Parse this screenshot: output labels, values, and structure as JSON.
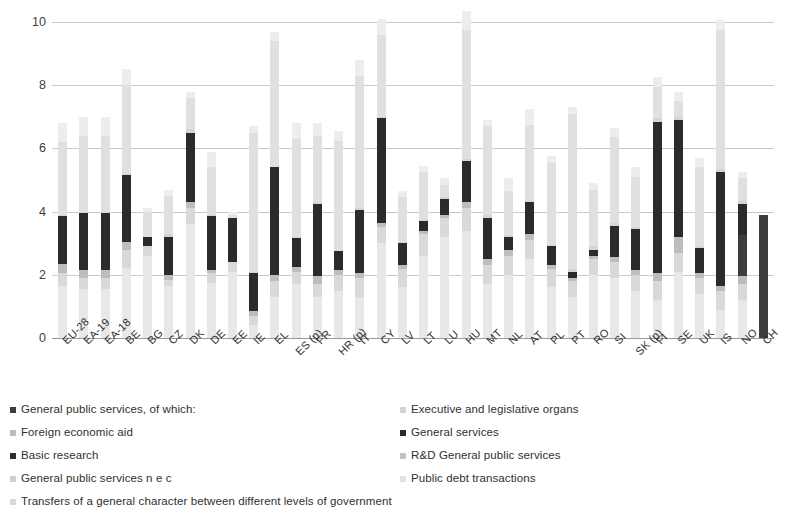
{
  "chart_data": {
    "type": "bar",
    "stacked": true,
    "title": "",
    "subtitle": "",
    "xlabel": "",
    "ylabel": "",
    "ylim": [
      0,
      10
    ],
    "yticks": [
      0,
      2,
      4,
      6,
      8,
      10
    ],
    "ytick_labels": [
      "0",
      "2",
      "4",
      "6",
      "8",
      "10"
    ],
    "grid": true,
    "legend_position": "bottom",
    "categories": [
      "EU-28",
      "EA-19",
      "EA-18",
      "BE",
      "BG",
      "CZ",
      "DK",
      "DE",
      "EE",
      "IE",
      "EL",
      "ES (p)",
      "FR",
      "HR (p)",
      "IT",
      "CY",
      "LV",
      "LT",
      "LU",
      "HU",
      "MT",
      "NL",
      "AT",
      "PL",
      "PT",
      "RO",
      "SI",
      "SK (p)",
      "FI",
      "SE",
      "UK",
      "IS",
      "NO",
      "CH"
    ],
    "series": [
      {
        "name": "Transfers of a general character between different levels of government",
        "color": "#ededed",
        "values": [
          0.6,
          0.6,
          0.6,
          0.5,
          0.1,
          0.2,
          0.2,
          0.5,
          0.1,
          0.2,
          0.3,
          0.5,
          0.4,
          0.3,
          0.5,
          0.5,
          0.2,
          0.2,
          0.2,
          0.6,
          0.2,
          0.4,
          0.5,
          0.2,
          0.2,
          0.2,
          0.3,
          0.3,
          0.3,
          0.3,
          0.3,
          0.3,
          0.2,
          0.0
        ]
      },
      {
        "name": "Public debt transactions",
        "color": "#e0e0e0",
        "values": [
          2.3,
          2.4,
          2.4,
          2.8,
          0.8,
          1.2,
          1.0,
          1.5,
          0.1,
          4.4,
          4.0,
          3.1,
          2.1,
          3.5,
          4.2,
          2.6,
          1.4,
          1.5,
          0.4,
          4.1,
          2.8,
          1.4,
          2.4,
          2.6,
          4.9,
          1.8,
          2.7,
          1.6,
          1.0,
          0.5,
          2.5,
          4.4,
          0.7,
          0.0
        ]
      },
      {
        "name": "R&D General public services",
        "color": "#d4d4d4",
        "values": [
          0.05,
          0.05,
          0.05,
          0.05,
          0.0,
          0.1,
          0.1,
          0.05,
          0.0,
          0.05,
          0.0,
          0.05,
          0.05,
          0.0,
          0.05,
          0.05,
          0.05,
          0.05,
          0.05,
          0.05,
          0.1,
          0.05,
          0.05,
          0.05,
          0.1,
          0.1,
          0.1,
          0.05,
          0.1,
          0.1,
          0.05,
          0.1,
          0.1,
          0.0
        ]
      },
      {
        "name": "Basic research",
        "color": "#2b2b2b",
        "values": [
          1.5,
          1.8,
          1.8,
          2.1,
          0.3,
          1.2,
          2.2,
          1.7,
          1.4,
          1.2,
          3.4,
          0.9,
          2.3,
          0.6,
          2.0,
          3.3,
          0.7,
          0.3,
          0.5,
          1.3,
          1.3,
          0.4,
          1.0,
          0.6,
          0.2,
          0.2,
          1.0,
          1.3,
          4.8,
          3.7,
          0.8,
          3.6,
          1.0,
          0.0
        ]
      },
      {
        "name": "General services",
        "color": "#3d3d3d",
        "values": [
          0.0,
          0.0,
          0.0,
          0.0,
          0.0,
          0.0,
          0.0,
          0.0,
          0.0,
          0.0,
          0.0,
          0.0,
          0.0,
          0.0,
          0.0,
          0.0,
          0.0,
          0.0,
          0.0,
          0.0,
          0.0,
          0.0,
          0.0,
          0.0,
          0.0,
          0.0,
          0.0,
          0.0,
          0.0,
          0.0,
          0.0,
          0.0,
          1.3,
          3.9
        ]
      },
      {
        "name": "Foreign economic aid",
        "color": "#bdbdbd",
        "values": [
          0.3,
          0.25,
          0.25,
          0.25,
          0.0,
          0.15,
          0.2,
          0.1,
          0.0,
          0.15,
          0.2,
          0.15,
          0.25,
          0.15,
          0.15,
          0.15,
          0.1,
          0.1,
          0.1,
          0.2,
          0.2,
          0.2,
          0.2,
          0.1,
          0.1,
          0.1,
          0.15,
          0.15,
          0.25,
          0.5,
          0.15,
          0.15,
          0.25,
          0.0
        ]
      },
      {
        "name": "General public services n e c",
        "color": "#d9d9d9",
        "values": [
          0.4,
          0.35,
          0.35,
          0.6,
          0.3,
          0.2,
          0.5,
          0.3,
          0.3,
          0.3,
          0.5,
          0.4,
          0.4,
          0.5,
          0.6,
          0.5,
          0.6,
          0.7,
          0.6,
          0.7,
          0.6,
          0.6,
          0.6,
          0.6,
          0.5,
          0.5,
          0.5,
          0.5,
          0.6,
          0.6,
          0.5,
          0.6,
          0.5,
          0.0
        ]
      },
      {
        "name": "Executive and legislative organs",
        "color": "#e8e8e8",
        "values": [
          1.65,
          1.55,
          1.55,
          2.2,
          2.6,
          1.65,
          3.6,
          1.75,
          2.1,
          0.4,
          1.3,
          1.7,
          1.3,
          1.5,
          1.3,
          3.0,
          1.6,
          2.6,
          3.2,
          3.4,
          1.7,
          2.0,
          2.5,
          1.6,
          1.3,
          2.0,
          1.9,
          1.5,
          1.2,
          2.1,
          1.4,
          0.9,
          1.2,
          0.0
        ]
      }
    ],
    "legend_entries": [
      {
        "label": "General public services, of which:",
        "color": "#3d3d3d"
      },
      {
        "label": "Executive and legislative organs",
        "color": "#cfcfcf"
      },
      {
        "label": "Foreign economic aid",
        "color": "#bdbdbd"
      },
      {
        "label": "General services",
        "color": "#2b2b2b"
      },
      {
        "label": "Basic research",
        "color": "#2b2b2b"
      },
      {
        "label": "R&D General public services",
        "color": "#bfbfbf"
      },
      {
        "label": "General public services n e c",
        "color": "#cfcfcf"
      },
      {
        "label": "Public debt transactions",
        "color": "#e0e0e0"
      },
      {
        "label": "Transfers of a general character between different levels of government",
        "color": "#d9d9d9"
      }
    ]
  },
  "legend": {
    "left_items": [
      {
        "label": "General public services, of which:",
        "color": "#3d3d3d",
        "name": "legend-general-public-services"
      },
      {
        "label": "Foreign economic aid",
        "color": "#bdbdbd",
        "name": "legend-foreign-economic-aid"
      },
      {
        "label": "Basic research",
        "color": "#2b2b2b",
        "name": "legend-basic-research"
      },
      {
        "label": "General public services n e c",
        "color": "#cfcfcf",
        "name": "legend-general-public-services-nec"
      }
    ],
    "right_items": [
      {
        "label": "Executive and legislative organs",
        "color": "#d4d4d4",
        "name": "legend-executive-legislative-organs"
      },
      {
        "label": "General services",
        "color": "#2b2b2b",
        "name": "legend-general-services"
      },
      {
        "label": "R&D General public services",
        "color": "#c2c2c2",
        "name": "legend-rd-general-public-services"
      },
      {
        "label": "Public debt transactions",
        "color": "#e2e2e2",
        "name": "legend-public-debt-transactions"
      }
    ],
    "wide_item": {
      "label": "Transfers of a general character between different levels of government",
      "color": "#d9d9d9"
    }
  },
  "colors": {
    "gridline": "#c9c9c9",
    "axis": "#9a9a9a",
    "text": "#303030",
    "background": "#ffffff"
  }
}
